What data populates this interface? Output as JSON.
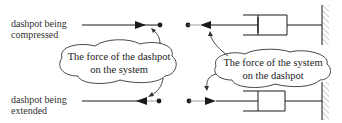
{
  "labels": {
    "top_row": "dashpot being compressed",
    "top_row_lines": [
      "dashpot being",
      "compressed"
    ],
    "bottom_row": "dashpot being extended",
    "bottom_row_lines": [
      "dashpot being",
      "extended"
    ]
  },
  "callouts": {
    "left": {
      "lines": [
        "The force of the dashpot",
        "on the system"
      ]
    },
    "right": {
      "lines": [
        "The force of the system",
        "on the dashpot"
      ]
    }
  },
  "colors": {
    "line": "#1a1a1a",
    "hatch": "#999999",
    "text": "#222222"
  }
}
